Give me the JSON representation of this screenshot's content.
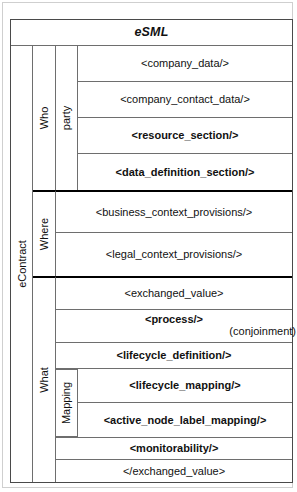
{
  "diagram": {
    "title": "eSML",
    "root_label": "eContract",
    "groups": [
      {
        "id": "who",
        "label": "Who"
      },
      {
        "id": "where",
        "label": "Where"
      },
      {
        "id": "what",
        "label": "What"
      }
    ],
    "subgroups": [
      {
        "id": "party",
        "label": "party"
      },
      {
        "id": "mapping",
        "label": "Mapping"
      }
    ],
    "rows": [
      {
        "id": "company_data",
        "text": "<company_data/>",
        "bold": false
      },
      {
        "id": "company_contact_data",
        "text": "<company_contact_data/>",
        "bold": false
      },
      {
        "id": "resource_section",
        "text": "<resource_section/>",
        "bold": true
      },
      {
        "id": "data_definition_section",
        "text": "<data_definition_section/>",
        "bold": true
      },
      {
        "id": "business_context_provisions",
        "text": "<business_context_provisions/>",
        "bold": false
      },
      {
        "id": "legal_context_provisions",
        "text": "<legal_context_provisions/>",
        "bold": false
      },
      {
        "id": "exchanged_value_open",
        "text": "<exchanged_value>",
        "bold": false
      },
      {
        "id": "process",
        "text": "<process/>",
        "bold": true,
        "annotation": "(conjoinment)"
      },
      {
        "id": "lifecycle_definition",
        "text": "<lifecycle_definition/>",
        "bold": true
      },
      {
        "id": "lifecycle_mapping",
        "text": "<lifecycle_mapping/>",
        "bold": true
      },
      {
        "id": "active_node_label_mapping",
        "text": "<active_node_label_mapping/>",
        "bold": true
      },
      {
        "id": "monitorability",
        "text": "<monitorability/>",
        "bold": true
      },
      {
        "id": "exchanged_value_close",
        "text": "</exchanged_value>",
        "bold": false
      }
    ],
    "colors": {
      "line": "#6e6e6e",
      "separator": "#000000",
      "frame": "#4a4a4a",
      "background": "#ffffff",
      "text": "#111111"
    }
  }
}
